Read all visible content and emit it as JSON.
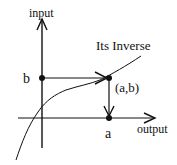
{
  "diagram": {
    "axes": {
      "vertical_label": "input",
      "horizontal_label": "output"
    },
    "curve_label": "Its Inverse",
    "points": {
      "b_label": "b",
      "a_label": "a",
      "ab_label": "(a,b)"
    },
    "colors": {
      "ink": "#111111",
      "background": "#ffffff"
    }
  }
}
